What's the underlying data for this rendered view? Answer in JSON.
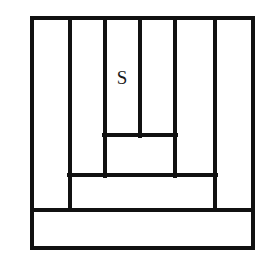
{
  "figure": {
    "kind": "rectangle-dissection-diagram",
    "canvas": {
      "width": 261,
      "height": 267
    },
    "style": {
      "background_color": "#ffffff",
      "stroke_color": "#111111",
      "outer_stroke_width": 4,
      "inner_stroke_width": 3.4,
      "label_color": "#1a1a1a"
    },
    "outer_rectangle": {
      "name": "outer-boundary",
      "x1": 32,
      "y1": 18,
      "x2": 253,
      "y2": 248,
      "width": 221,
      "height": 230
    },
    "vertical_segments": [
      {
        "name": "vertical-1",
        "x": 70,
        "y1": 18,
        "y2": 210
      },
      {
        "name": "vertical-2",
        "x": 105,
        "y1": 18,
        "y2": 176
      },
      {
        "name": "vertical-3",
        "x": 140,
        "y1": 18,
        "y2": 136
      },
      {
        "name": "vertical-4",
        "x": 175,
        "y1": 18,
        "y2": 176
      },
      {
        "name": "vertical-5",
        "x": 215,
        "y1": 18,
        "y2": 210
      }
    ],
    "horizontal_segments": [
      {
        "name": "horizontal-1",
        "y": 135,
        "x1": 104,
        "x2": 176
      },
      {
        "name": "horizontal-2",
        "y": 175,
        "x1": 69,
        "x2": 216
      },
      {
        "name": "horizontal-3",
        "y": 210,
        "x1": 32,
        "x2": 253
      }
    ],
    "labels": [
      {
        "name": "region-label-s",
        "text": "S",
        "x": 122,
        "y": 84,
        "font_size": 19
      }
    ]
  }
}
